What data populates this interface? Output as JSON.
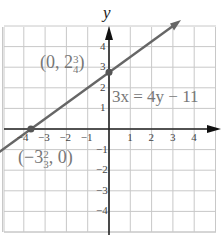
{
  "chart_data": {
    "type": "line",
    "title": "",
    "xlabel": "",
    "ylabel": "y",
    "xlim": [
      -5,
      5
    ],
    "ylim": [
      -5,
      5
    ],
    "grid": true,
    "x_ticks": [
      "-4",
      "-3",
      "-2",
      "-1",
      "1",
      "2",
      "3",
      "4"
    ],
    "y_ticks": [
      "4",
      "3",
      "2",
      "1",
      "-1",
      "-2",
      "-3",
      "-4"
    ],
    "series": [
      {
        "name": "3x = 4y - 11",
        "equation": "3x = 4y - 11",
        "x": [
          -5,
          3
        ],
        "y": [
          -1,
          5
        ]
      }
    ],
    "points": [
      {
        "x": 0,
        "y": 2.75,
        "label": "(0, 2 3/4)"
      },
      {
        "x": -3.6667,
        "y": 0,
        "label": "(-3 2/3, 0)"
      }
    ],
    "annotations": [
      "(0, 2 3/4)",
      "3x = 4y - 11",
      "(-3 2/3, 0)"
    ]
  },
  "labels": {
    "y_axis": "y",
    "equation": "3x = 4y − 11",
    "y_intercept_prefix": "(0, 2",
    "y_intercept_num": "3",
    "y_intercept_den": "4",
    "y_intercept_suffix": ")",
    "x_intercept_prefix": "(−3",
    "x_intercept_num": "2",
    "x_intercept_den": "3",
    "x_intercept_suffix": ", 0)"
  },
  "ticks": {
    "x": [
      {
        "v": -4,
        "t": "−4"
      },
      {
        "v": -3,
        "t": "−3"
      },
      {
        "v": -2,
        "t": "−2"
      },
      {
        "v": -1,
        "t": "−1"
      },
      {
        "v": 1,
        "t": "1"
      },
      {
        "v": 2,
        "t": "2"
      },
      {
        "v": 3,
        "t": "3"
      },
      {
        "v": 4,
        "t": "4"
      }
    ],
    "y": [
      {
        "v": 4,
        "t": "4"
      },
      {
        "v": 3,
        "t": "3"
      },
      {
        "v": 2,
        "t": "2"
      },
      {
        "v": 1,
        "t": "1"
      },
      {
        "v": -1,
        "t": "−1"
      },
      {
        "v": -2,
        "t": "−2"
      },
      {
        "v": -3,
        "t": "−3"
      },
      {
        "v": -4,
        "t": "−4"
      }
    ]
  }
}
